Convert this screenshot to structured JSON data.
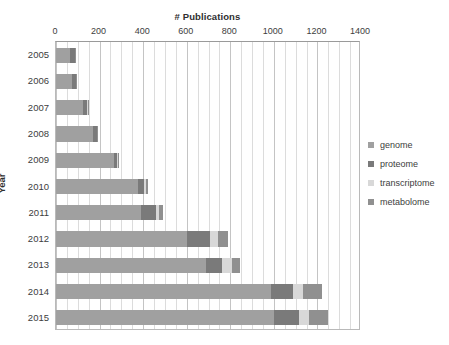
{
  "chart_data": {
    "type": "bar",
    "subtype": "stacked-horizontal-bar",
    "title": "# Publications",
    "xlabel": "# Publications",
    "ylabel": "Year",
    "xlim": [
      0,
      1400
    ],
    "ylim": null,
    "grid": true,
    "grid_axis": "x",
    "minor_gridlines": true,
    "legend_position": "right",
    "categories": [
      "2005",
      "2006",
      "2007",
      "2008",
      "2009",
      "2010",
      "2011",
      "2012",
      "2013",
      "2014",
      "2015"
    ],
    "x_ticks": [
      0,
      200,
      400,
      600,
      800,
      1000,
      1200,
      1400
    ],
    "x_tick_labels": [
      "0",
      "200",
      "400",
      "600",
      "800",
      "1000",
      "1200",
      "1400"
    ],
    "series": [
      {
        "name": "genome",
        "color": "#a0a0a0",
        "values": [
          62,
          72,
          125,
          170,
          265,
          375,
          390,
          600,
          690,
          985,
          1000
        ]
      },
      {
        "name": "proteome",
        "color": "#7a7a7a",
        "values": [
          25,
          18,
          18,
          17,
          15,
          28,
          70,
          105,
          70,
          105,
          115
        ]
      },
      {
        "name": "transcriptome",
        "color": "#d8d8d8",
        "values": [
          2,
          2,
          3,
          3,
          6,
          10,
          12,
          40,
          50,
          45,
          45
        ]
      },
      {
        "name": "metabolome",
        "color": "#909090",
        "values": [
          2,
          2,
          3,
          3,
          5,
          8,
          18,
          45,
          35,
          85,
          90
        ]
      }
    ],
    "totals": [
      91,
      94,
      149,
      193,
      291,
      421,
      490,
      790,
      845,
      1220,
      1250
    ]
  },
  "legend": {
    "items": [
      {
        "label": "genome",
        "color": "#a0a0a0"
      },
      {
        "label": "proteome",
        "color": "#7a7a7a"
      },
      {
        "label": "transcriptome",
        "color": "#d8d8d8"
      },
      {
        "label": "metabolome",
        "color": "#909090"
      }
    ]
  },
  "axes": {
    "x_title": "# Publications",
    "y_title": "Year"
  }
}
